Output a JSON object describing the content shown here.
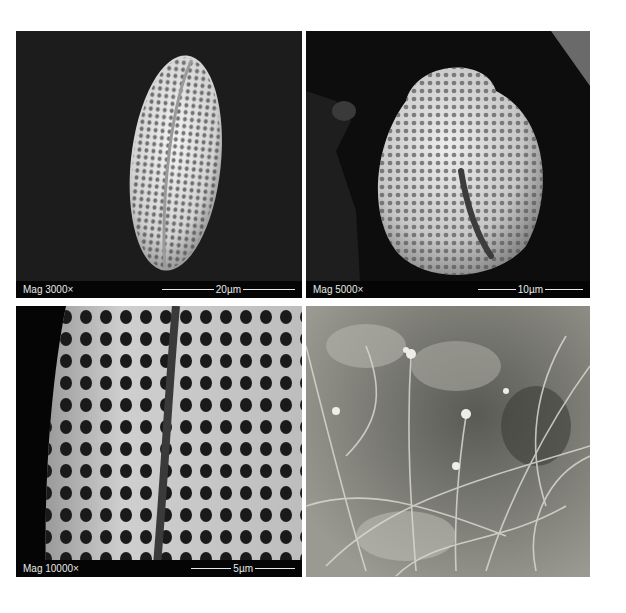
{
  "figure": {
    "panels": [
      {
        "id": "a",
        "type": "SEM micrograph",
        "subject": "elongated tricolpate pollen grain, reticulate exine",
        "magnification": "Mag 3000×",
        "scale_bar": "20µm"
      },
      {
        "id": "b",
        "type": "SEM micrograph",
        "subject": "pollen grain, polar/oblique view showing colpus",
        "magnification": "Mag 5000×",
        "scale_bar": "10µm"
      },
      {
        "id": "c",
        "type": "SEM micrograph",
        "subject": "close-up of reticulate exine and colpus",
        "magnification": "Mag 10000×",
        "scale_bar": "5µm"
      },
      {
        "id": "d",
        "type": "photograph",
        "subject": "small flowering plant among grasses (monochrome)"
      }
    ]
  }
}
